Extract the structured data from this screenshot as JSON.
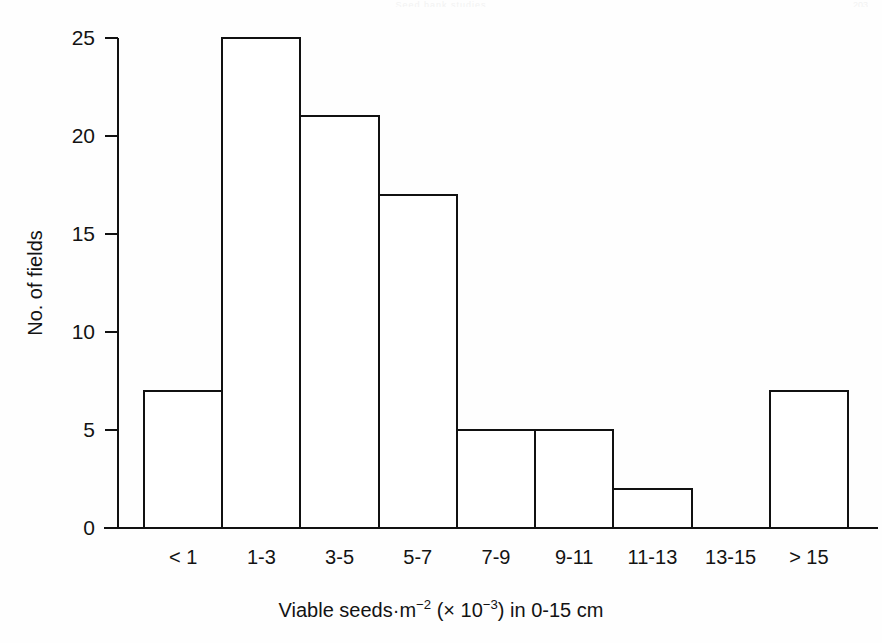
{
  "figure": {
    "running_head": "Seed bank studies",
    "page_number": "203"
  },
  "chart_data": {
    "type": "bar",
    "title": "",
    "subtitle": "",
    "categories": [
      "< 1",
      "1-3",
      "3-5",
      "5-7",
      "7-9",
      "9-11",
      "11-13",
      "13-15",
      "> 15"
    ],
    "values": [
      7,
      25,
      21,
      17,
      5,
      5,
      2,
      0,
      7
    ],
    "series": [
      {
        "name": "No. of fields",
        "values": [
          7,
          25,
          21,
          17,
          5,
          5,
          2,
          0,
          7
        ]
      }
    ],
    "xlabel": "Viable seeds·m−2 (× 10−3) in 0-15 cm",
    "xlabel_parts": {
      "lead": "Viable seeds·m",
      "sup1": "−2",
      "mid": " (× 10",
      "sup2": "−3",
      "tail": ") in 0-15 cm"
    },
    "ylabel": "No. of fields",
    "ylim": [
      0,
      25
    ],
    "xlim": [
      0,
      9
    ],
    "yticks": [
      0,
      5,
      10,
      15,
      20,
      25
    ],
    "ytick_labels": [
      "0",
      "5",
      "10",
      "15",
      "20",
      "25"
    ],
    "grid": false,
    "legend": false,
    "legend_position": "none",
    "bar_style": {
      "fill": "#ffffff",
      "stroke": "#111111",
      "stroke_width": 2,
      "gap": 0
    },
    "axis_color": "#111111",
    "background": "#fefefe"
  }
}
